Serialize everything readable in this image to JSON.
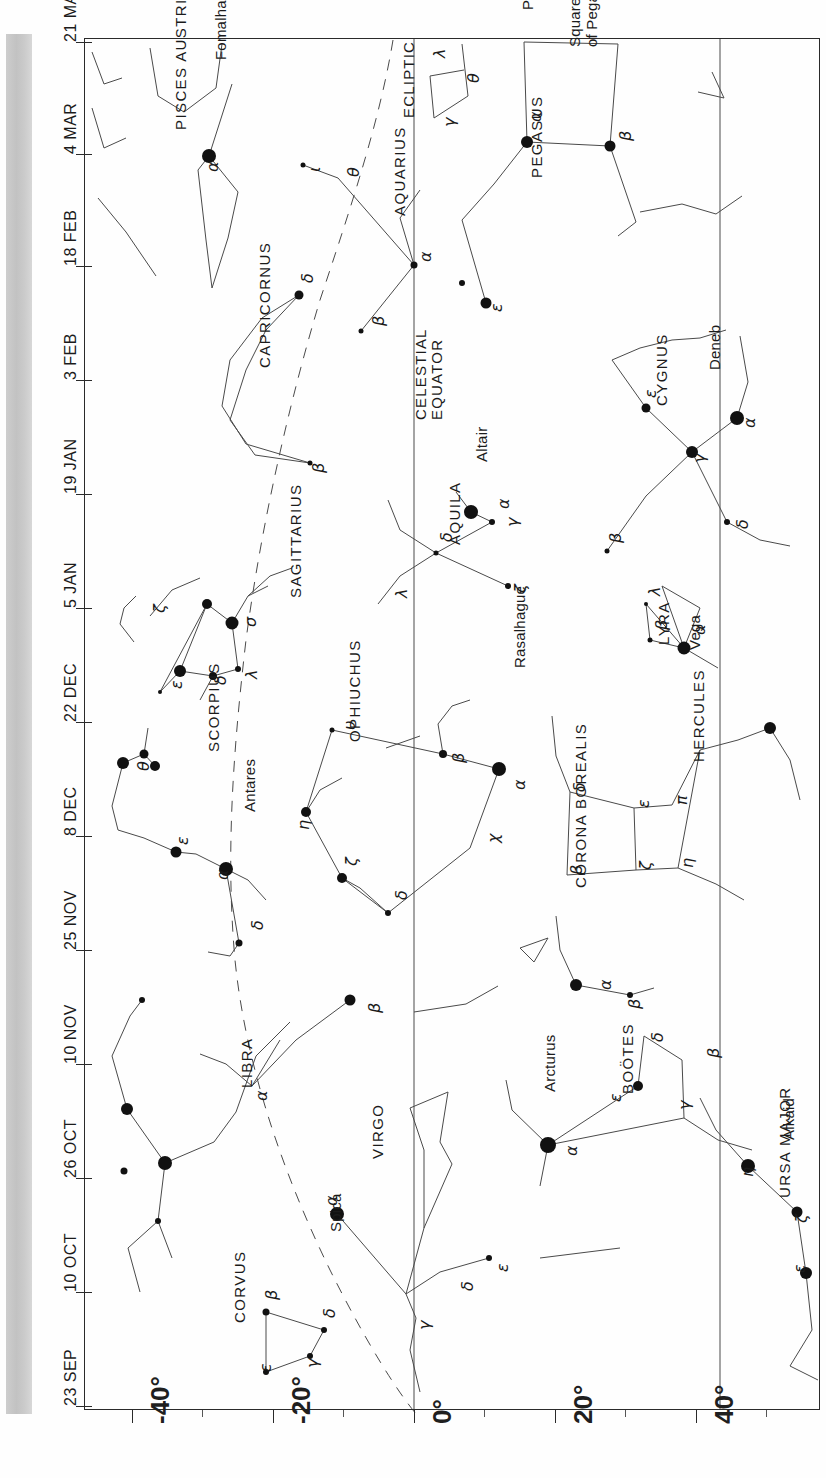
{
  "chart_data": {
    "type": "scatter",
    "xlabel": "Declination",
    "ylabel": "Date",
    "xlim": [
      -50,
      50
    ],
    "ylim_dates": [
      "23 SEP",
      "21 MAR"
    ],
    "grid": false,
    "legend": null,
    "orientation": "rotated-90",
    "axes": {
      "date_axis": {
        "labels": [
          "21 MAR",
          "4 MAR",
          "18 FEB",
          "3 FEB",
          "19 JAN",
          "5 JAN",
          "22 DEC",
          "8 DEC",
          "25 NOV",
          "10 NOV",
          "26 OCT",
          "10 OCT",
          "23 SEP"
        ],
        "positions_px": [
          42,
          154,
          266,
          380,
          494,
          608,
          722,
          836,
          950,
          1064,
          1178,
          1292,
          1406
        ]
      },
      "declination_axis": {
        "labels": [
          "-40°",
          "-20°",
          "0°",
          "20°",
          "40°"
        ],
        "values": [
          -40,
          -20,
          0,
          20,
          40
        ],
        "positions_px": [
          132,
          273,
          414,
          555,
          696
        ],
        "minor_ticks_px": [
          202,
          343,
          484,
          625,
          766
        ]
      }
    },
    "reference_lines": [
      {
        "name": "ECLIPTIC",
        "style": "dashed"
      },
      {
        "name": "CELESTIAL EQUATOR",
        "style": "solid"
      }
    ],
    "constellations": [
      {
        "name": "PISCES AUSTRINUS",
        "stars": [
          {
            "greek": "α",
            "proper": "Fomalhaut"
          }
        ]
      },
      {
        "name": "PISCES",
        "stars": [
          {
            "greek": "λ"
          },
          {
            "greek": "θ"
          },
          {
            "greek": "γ"
          }
        ]
      },
      {
        "name": "PEGASUS",
        "note": "Square of Pegasus",
        "stars": [
          {
            "greek": "α"
          },
          {
            "greek": "β"
          },
          {
            "greek": "ε"
          }
        ]
      },
      {
        "name": "AQUARIUS",
        "stars": [
          {
            "greek": "α"
          },
          {
            "greek": "β"
          },
          {
            "greek": "θ"
          },
          {
            "greek": "ι"
          },
          {
            "greek": "δ"
          }
        ]
      },
      {
        "name": "CAPRICORNUS",
        "stars": [
          {
            "greek": "δ"
          },
          {
            "greek": "β"
          }
        ]
      },
      {
        "name": "CYGNUS",
        "stars": [
          {
            "greek": "α",
            "proper": "Deneb"
          },
          {
            "greek": "γ"
          },
          {
            "greek": "ε"
          },
          {
            "greek": "δ"
          },
          {
            "greek": "β"
          }
        ]
      },
      {
        "name": "LYRA",
        "stars": [
          {
            "greek": "α",
            "proper": "Vega"
          },
          {
            "greek": "β"
          },
          {
            "greek": "λ"
          }
        ]
      },
      {
        "name": "AQUILA",
        "stars": [
          {
            "greek": "α",
            "proper": "Altair"
          },
          {
            "greek": "γ"
          },
          {
            "greek": "δ"
          },
          {
            "greek": "ζ"
          },
          {
            "greek": "λ"
          }
        ]
      },
      {
        "name": "SAGITTARIUS",
        "stars": [
          {
            "greek": "σ"
          },
          {
            "greek": "ζ"
          },
          {
            "greek": "λ"
          },
          {
            "greek": "δ"
          },
          {
            "greek": "ε"
          }
        ]
      },
      {
        "name": "SCORPIUS",
        "stars": [
          {
            "greek": "α",
            "proper": "Antares"
          },
          {
            "greek": "θ"
          },
          {
            "greek": "ε"
          },
          {
            "greek": "δ"
          }
        ]
      },
      {
        "name": "OPHIUCHUS",
        "stars": [
          {
            "greek": "α",
            "proper": "Rasalhague"
          },
          {
            "greek": "β"
          },
          {
            "greek": "υ"
          },
          {
            "greek": "η"
          },
          {
            "greek": "ζ"
          },
          {
            "greek": "δ"
          },
          {
            "greek": "χ"
          }
        ]
      },
      {
        "name": "HERCULES",
        "stars": [
          {
            "greek": "δ"
          },
          {
            "greek": "ε"
          },
          {
            "greek": "π"
          },
          {
            "greek": "ζ"
          },
          {
            "greek": "η"
          }
        ]
      },
      {
        "name": "CORONA BOREALIS",
        "stars": [
          {
            "greek": "α"
          },
          {
            "greek": "β"
          }
        ]
      },
      {
        "name": "BOÖTES",
        "stars": [
          {
            "greek": "α",
            "proper": "Arcturus"
          },
          {
            "greek": "ε"
          },
          {
            "greek": "δ"
          },
          {
            "greek": "β"
          },
          {
            "greek": "γ"
          }
        ]
      },
      {
        "name": "URSA MAJOR",
        "stars": [
          {
            "greek": "η",
            "proper": "Alkaid"
          },
          {
            "greek": "ζ"
          },
          {
            "greek": "ε"
          }
        ]
      },
      {
        "name": "LIBRA",
        "stars": [
          {
            "greek": "α"
          }
        ]
      },
      {
        "name": "VIRGO",
        "stars": [
          {
            "greek": "α",
            "proper": "Spica"
          },
          {
            "greek": "γ"
          },
          {
            "greek": "δ"
          },
          {
            "greek": "ε"
          }
        ]
      },
      {
        "name": "CORVUS",
        "stars": [
          {
            "greek": "β"
          },
          {
            "greek": "δ"
          },
          {
            "greek": "γ"
          },
          {
            "greek": "ε"
          }
        ]
      }
    ]
  },
  "dates": [
    {
      "label": "21 MAR",
      "y": 42
    },
    {
      "label": "4 MAR",
      "y": 154
    },
    {
      "label": "18 FEB",
      "y": 266
    },
    {
      "label": "3 FEB",
      "y": 380
    },
    {
      "label": "19 JAN",
      "y": 494
    },
    {
      "label": "5 JAN",
      "y": 608
    },
    {
      "label": "22 DEC",
      "y": 722
    },
    {
      "label": "8 DEC",
      "y": 836
    },
    {
      "label": "25 NOV",
      "y": 950
    },
    {
      "label": "10 NOV",
      "y": 1064
    },
    {
      "label": "26 OCT",
      "y": 1178
    },
    {
      "label": "10 OCT",
      "y": 1292
    },
    {
      "label": "23 SEP",
      "y": 1406
    }
  ],
  "declinations": [
    {
      "label": "-40°",
      "x": 132
    },
    {
      "label": "-20°",
      "x": 273
    },
    {
      "label": "0°",
      "x": 414
    },
    {
      "label": "20°",
      "x": 555
    },
    {
      "label": "40°",
      "x": 696
    }
  ],
  "axis_titles": {
    "ecliptic": "ECLIPTIC",
    "celestial_equator_1": "CELESTIAL",
    "celestial_equator_2": "EQUATOR"
  },
  "constellation_labels": [
    {
      "id": "pisces-austrinus",
      "text": "PISCES AUSTRINUS",
      "x": 172,
      "y": 130,
      "cls": "con"
    },
    {
      "id": "pisces",
      "text": "PISCES",
      "x": 519,
      "y": 10,
      "cls": "con"
    },
    {
      "id": "pegasus",
      "text": "PEGASUS",
      "x": 528,
      "y": 178,
      "cls": "con"
    },
    {
      "id": "square-of-pegasus-1",
      "text": "Square",
      "x": 566,
      "y": 47,
      "cls": "name"
    },
    {
      "id": "square-of-pegasus-2",
      "text": "of Pegasus",
      "x": 583,
      "y": 47,
      "cls": "name"
    },
    {
      "id": "aquarius",
      "text": "AQUARIUS",
      "x": 391,
      "y": 216,
      "cls": "con"
    },
    {
      "id": "capricornus",
      "text": "CAPRICORNUS",
      "x": 256,
      "y": 368,
      "cls": "con"
    },
    {
      "id": "cygnus",
      "text": "CYGNUS",
      "x": 653,
      "y": 406,
      "cls": "con"
    },
    {
      "id": "lyra",
      "text": "LYRA",
      "x": 655,
      "y": 645,
      "cls": "con"
    },
    {
      "id": "aquila",
      "text": "AQUILA",
      "x": 446,
      "y": 545,
      "cls": "con"
    },
    {
      "id": "sagittarius",
      "text": "SAGITTARIUS",
      "x": 287,
      "y": 598,
      "cls": "con"
    },
    {
      "id": "scorpius",
      "text": "SCORPIUS",
      "x": 205,
      "y": 752,
      "cls": "con"
    },
    {
      "id": "ophiuchus",
      "text": "OPHIUCHUS",
      "x": 346,
      "y": 742,
      "cls": "con"
    },
    {
      "id": "hercules",
      "text": "HERCULES",
      "x": 690,
      "y": 762,
      "cls": "con"
    },
    {
      "id": "corona-borealis",
      "text": "CORONA BOREALIS",
      "x": 572,
      "y": 888,
      "cls": "con"
    },
    {
      "id": "bootes",
      "text": "BOÖTES",
      "x": 619,
      "y": 1094,
      "cls": "con"
    },
    {
      "id": "ursa-major",
      "text": "URSA MAJOR",
      "x": 776,
      "y": 1198,
      "cls": "con"
    },
    {
      "id": "libra",
      "text": "LIBRA",
      "x": 238,
      "y": 1088,
      "cls": "con"
    },
    {
      "id": "virgo",
      "text": "VIRGO",
      "x": 369,
      "y": 1159,
      "cls": "con"
    },
    {
      "id": "corvus",
      "text": "CORVUS",
      "x": 231,
      "y": 1323,
      "cls": "con"
    }
  ],
  "star_names": [
    {
      "id": "fomalhaut",
      "text": "Fomalhaut",
      "x": 212,
      "y": 60
    },
    {
      "id": "deneb",
      "text": "Deneb",
      "x": 706,
      "y": 370
    },
    {
      "id": "vega",
      "text": "Vega",
      "x": 686,
      "y": 650
    },
    {
      "id": "altair",
      "text": "Altair",
      "x": 473,
      "y": 462
    },
    {
      "id": "rasalhague",
      "text": "Rasalhague",
      "x": 511,
      "y": 668
    },
    {
      "id": "antares",
      "text": "Antares",
      "x": 241,
      "y": 812
    },
    {
      "id": "arcturus",
      "text": "Arcturus",
      "x": 541,
      "y": 1092
    },
    {
      "id": "alkaid",
      "text": "Alkaid",
      "x": 780,
      "y": 1140
    },
    {
      "id": "spica",
      "text": "Spica",
      "x": 327,
      "y": 1232
    }
  ],
  "greek_labels": [
    {
      "text": "α",
      "x": 203,
      "y": 172
    },
    {
      "text": "λ",
      "x": 430,
      "y": 58
    },
    {
      "text": "θ",
      "x": 464,
      "y": 83
    },
    {
      "text": "γ",
      "x": 440,
      "y": 127
    },
    {
      "text": "α",
      "x": 526,
      "y": 122
    },
    {
      "text": "β",
      "x": 616,
      "y": 141
    },
    {
      "text": "ε",
      "x": 487,
      "y": 312
    },
    {
      "text": "α",
      "x": 416,
      "y": 262
    },
    {
      "text": "β",
      "x": 369,
      "y": 326
    },
    {
      "text": "θ",
      "x": 344,
      "y": 177
    },
    {
      "text": "ι",
      "x": 305,
      "y": 172
    },
    {
      "text": "δ",
      "x": 298,
      "y": 283
    },
    {
      "text": "β",
      "x": 309,
      "y": 473
    },
    {
      "text": "α",
      "x": 740,
      "y": 428
    },
    {
      "text": "γ",
      "x": 690,
      "y": 463
    },
    {
      "text": "ε",
      "x": 641,
      "y": 398
    },
    {
      "text": "δ",
      "x": 733,
      "y": 529
    },
    {
      "text": "β",
      "x": 606,
      "y": 543
    },
    {
      "text": "α",
      "x": 690,
      "y": 635
    },
    {
      "text": "β",
      "x": 652,
      "y": 630
    },
    {
      "text": "λ",
      "x": 645,
      "y": 596
    },
    {
      "text": "α",
      "x": 494,
      "y": 509
    },
    {
      "text": "γ",
      "x": 503,
      "y": 527
    },
    {
      "text": "δ",
      "x": 437,
      "y": 542
    },
    {
      "text": "ζ",
      "x": 511,
      "y": 593
    },
    {
      "text": "λ",
      "x": 392,
      "y": 598
    },
    {
      "text": "σ",
      "x": 241,
      "y": 627
    },
    {
      "text": "ζ",
      "x": 150,
      "y": 613
    },
    {
      "text": "λ",
      "x": 242,
      "y": 679
    },
    {
      "text": "δ",
      "x": 211,
      "y": 685
    },
    {
      "text": "ε",
      "x": 167,
      "y": 689
    },
    {
      "text": "θ",
      "x": 134,
      "y": 771
    },
    {
      "text": "ε",
      "x": 173,
      "y": 845
    },
    {
      "text": "α",
      "x": 213,
      "y": 880
    },
    {
      "text": "δ",
      "x": 248,
      "y": 930
    },
    {
      "text": "υ",
      "x": 340,
      "y": 730
    },
    {
      "text": "β",
      "x": 449,
      "y": 763
    },
    {
      "text": "α",
      "x": 510,
      "y": 790
    },
    {
      "text": "η",
      "x": 294,
      "y": 830
    },
    {
      "text": "ζ",
      "x": 342,
      "y": 866
    },
    {
      "text": "χ",
      "x": 484,
      "y": 843
    },
    {
      "text": "δ",
      "x": 392,
      "y": 900
    },
    {
      "text": "δ",
      "x": 570,
      "y": 792
    },
    {
      "text": "ε",
      "x": 634,
      "y": 808
    },
    {
      "text": "π",
      "x": 672,
      "y": 805
    },
    {
      "text": "ζ",
      "x": 636,
      "y": 870
    },
    {
      "text": "η",
      "x": 678,
      "y": 868
    },
    {
      "text": "β",
      "x": 567,
      "y": 875
    },
    {
      "text": "α",
      "x": 596,
      "y": 990
    },
    {
      "text": "β",
      "x": 625,
      "y": 1009
    },
    {
      "text": "δ",
      "x": 648,
      "y": 1042
    },
    {
      "text": "β",
      "x": 704,
      "y": 1058
    },
    {
      "text": "ε",
      "x": 606,
      "y": 1102
    },
    {
      "text": "γ",
      "x": 675,
      "y": 1110
    },
    {
      "text": "α",
      "x": 562,
      "y": 1156
    },
    {
      "text": "η",
      "x": 738,
      "y": 1177
    },
    {
      "text": "ζ",
      "x": 792,
      "y": 1223
    },
    {
      "text": "ε",
      "x": 790,
      "y": 1273
    },
    {
      "text": "α",
      "x": 252,
      "y": 1101
    },
    {
      "text": "β",
      "x": 365,
      "y": 1013
    },
    {
      "text": "α",
      "x": 322,
      "y": 1206
    },
    {
      "text": "γ",
      "x": 415,
      "y": 1330
    },
    {
      "text": "δ",
      "x": 458,
      "y": 1291
    },
    {
      "text": "ε",
      "x": 493,
      "y": 1272
    },
    {
      "text": "β",
      "x": 262,
      "y": 1300
    },
    {
      "text": "δ",
      "x": 320,
      "y": 1318
    },
    {
      "text": "γ",
      "x": 303,
      "y": 1368
    },
    {
      "text": "ε",
      "x": 256,
      "y": 1372
    }
  ],
  "stars": [
    {
      "x": 209,
      "y": 156,
      "r": 7
    },
    {
      "x": 527,
      "y": 142,
      "r": 6
    },
    {
      "x": 610,
      "y": 146,
      "r": 5.5
    },
    {
      "x": 486,
      "y": 303,
      "r": 5.5
    },
    {
      "x": 414,
      "y": 265,
      "r": 3.5
    },
    {
      "x": 361,
      "y": 331,
      "r": 2.5
    },
    {
      "x": 303,
      "y": 165,
      "r": 2.5
    },
    {
      "x": 299,
      "y": 295,
      "r": 4.5
    },
    {
      "x": 310,
      "y": 463,
      "r": 2.5
    },
    {
      "x": 737,
      "y": 418,
      "r": 7
    },
    {
      "x": 692,
      "y": 452,
      "r": 6
    },
    {
      "x": 646,
      "y": 408,
      "r": 4.5
    },
    {
      "x": 727,
      "y": 522,
      "r": 3
    },
    {
      "x": 607,
      "y": 551,
      "r": 2.5
    },
    {
      "x": 684,
      "y": 648,
      "r": 6.5
    },
    {
      "x": 650,
      "y": 640,
      "r": 2.5
    },
    {
      "x": 646,
      "y": 604,
      "r": 2
    },
    {
      "x": 471,
      "y": 512,
      "r": 7
    },
    {
      "x": 492,
      "y": 522,
      "r": 3
    },
    {
      "x": 436,
      "y": 553,
      "r": 2.5
    },
    {
      "x": 508,
      "y": 586,
      "r": 3
    },
    {
      "x": 232,
      "y": 623,
      "r": 6.5
    },
    {
      "x": 207,
      "y": 604,
      "r": 5
    },
    {
      "x": 180,
      "y": 671,
      "r": 6
    },
    {
      "x": 238,
      "y": 669,
      "r": 3
    },
    {
      "x": 213,
      "y": 676,
      "r": 4
    },
    {
      "x": 160,
      "y": 692,
      "r": 2
    },
    {
      "x": 155,
      "y": 766,
      "r": 5
    },
    {
      "x": 144,
      "y": 754,
      "r": 4.5
    },
    {
      "x": 123,
      "y": 763,
      "r": 6
    },
    {
      "x": 176,
      "y": 852,
      "r": 5.5
    },
    {
      "x": 226,
      "y": 869,
      "r": 7
    },
    {
      "x": 239,
      "y": 943,
      "r": 3.5
    },
    {
      "x": 332,
      "y": 730,
      "r": 2.5
    },
    {
      "x": 443,
      "y": 754,
      "r": 4
    },
    {
      "x": 499,
      "y": 769,
      "r": 7
    },
    {
      "x": 306,
      "y": 812,
      "r": 5
    },
    {
      "x": 342,
      "y": 878,
      "r": 5
    },
    {
      "x": 388,
      "y": 913,
      "r": 3
    },
    {
      "x": 576,
      "y": 985,
      "r": 6
    },
    {
      "x": 630,
      "y": 995,
      "r": 3
    },
    {
      "x": 548,
      "y": 1145,
      "r": 8
    },
    {
      "x": 638,
      "y": 1086,
      "r": 5
    },
    {
      "x": 748,
      "y": 1166,
      "r": 7
    },
    {
      "x": 797,
      "y": 1212,
      "r": 5.5
    },
    {
      "x": 806,
      "y": 1273,
      "r": 6
    },
    {
      "x": 337,
      "y": 1214,
      "r": 7
    },
    {
      "x": 350,
      "y": 1000,
      "r": 5.5
    },
    {
      "x": 142,
      "y": 1000,
      "r": 3
    },
    {
      "x": 127,
      "y": 1109,
      "r": 6
    },
    {
      "x": 165,
      "y": 1163,
      "r": 7
    },
    {
      "x": 124,
      "y": 1171,
      "r": 3.5
    },
    {
      "x": 158,
      "y": 1221,
      "r": 3
    },
    {
      "x": 489,
      "y": 1258,
      "r": 3
    },
    {
      "x": 266,
      "y": 1312,
      "r": 3.5
    },
    {
      "x": 324,
      "y": 1330,
      "r": 3
    },
    {
      "x": 310,
      "y": 1356,
      "r": 3
    },
    {
      "x": 266,
      "y": 1372,
      "r": 3
    },
    {
      "x": 770,
      "y": 728,
      "r": 6
    },
    {
      "x": 462,
      "y": 283,
      "r": 3
    }
  ]
}
